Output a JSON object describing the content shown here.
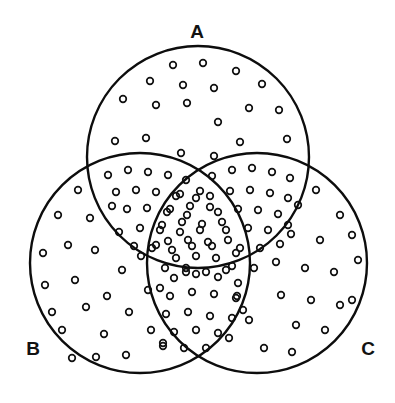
{
  "figure": {
    "type": "venn-diagram",
    "title": "",
    "width": 395,
    "height": 403,
    "background_color": "#ffffff",
    "stroke_color": "#0d0d0d",
    "dot_stroke_color": "#111111",
    "label_color": "#121212"
  },
  "sets": [
    {
      "id": "A",
      "label": "A",
      "label_x": 197,
      "label_y": 33,
      "cx": 198,
      "cy": 157,
      "r": 111
    },
    {
      "id": "B",
      "label": "B",
      "label_x": 33,
      "label_y": 350,
      "cx": 140,
      "cy": 263,
      "r": 110
    },
    {
      "id": "C",
      "label": "C",
      "label_x": 368,
      "label_y": 350,
      "cx": 257,
      "cy": 263,
      "r": 110
    }
  ],
  "shading": {
    "style": "open-circle-stipple",
    "dot_radius": 3.3,
    "description": "All regions of all three circles are filled with small open circles; overlap regions are stippled more densely."
  },
  "chart_data": {
    "type": "venn",
    "title": "",
    "sets": [
      "A",
      "B",
      "C"
    ],
    "region_density": [
      {
        "region": "A only",
        "density": "sparse"
      },
      {
        "region": "B only",
        "density": "sparse"
      },
      {
        "region": "C only",
        "density": "sparse"
      },
      {
        "region": "A and B",
        "density": "dense"
      },
      {
        "region": "A and C",
        "density": "dense"
      },
      {
        "region": "B and C",
        "density": "dense"
      },
      {
        "region": "A and B and C",
        "density": "dense"
      }
    ],
    "legend": [],
    "xlabel": "",
    "ylabel": ""
  },
  "dots": {
    "A_only": [
      [
        173,
        65
      ],
      [
        203,
        63
      ],
      [
        236,
        71
      ],
      [
        150,
        81
      ],
      [
        183,
        85
      ],
      [
        214,
        88
      ],
      [
        262,
        84
      ],
      [
        123,
        99
      ],
      [
        156,
        105
      ],
      [
        187,
        103
      ],
      [
        249,
        108
      ],
      [
        279,
        110
      ],
      [
        218,
        122
      ],
      [
        115,
        141
      ],
      [
        146,
        138
      ],
      [
        240,
        142
      ],
      [
        287,
        139
      ],
      [
        181,
        153
      ],
      [
        214,
        156
      ]
    ],
    "B_only": [
      [
        78,
        190
      ],
      [
        58,
        215
      ],
      [
        90,
        218
      ],
      [
        68,
        245
      ],
      [
        43,
        253
      ],
      [
        95,
        250
      ],
      [
        119,
        232
      ],
      [
        45,
        285
      ],
      [
        75,
        280
      ],
      [
        122,
        270
      ],
      [
        52,
        312
      ],
      [
        86,
        307
      ],
      [
        107,
        296
      ],
      [
        129,
        312
      ],
      [
        62,
        330
      ],
      [
        104,
        334
      ],
      [
        148,
        290
      ],
      [
        141,
        256
      ],
      [
        151,
        330
      ],
      [
        126,
        355
      ],
      [
        163,
        346
      ],
      [
        96,
        357
      ],
      [
        72,
        358
      ]
    ],
    "C_only": [
      [
        316,
        190
      ],
      [
        340,
        215
      ],
      [
        298,
        205
      ],
      [
        291,
        234
      ],
      [
        320,
        240
      ],
      [
        352,
        235
      ],
      [
        276,
        262
      ],
      [
        305,
        268
      ],
      [
        334,
        272
      ],
      [
        358,
        260
      ],
      [
        281,
        295
      ],
      [
        311,
        300
      ],
      [
        340,
        305
      ],
      [
        296,
        325
      ],
      [
        325,
        330
      ],
      [
        352,
        300
      ],
      [
        249,
        320
      ],
      [
        264,
        348
      ],
      [
        292,
        352
      ],
      [
        237,
        296
      ],
      [
        229,
        338
      ]
    ],
    "AB_lens": [
      [
        108,
        175
      ],
      [
        128,
        170
      ],
      [
        148,
        172
      ],
      [
        168,
        175
      ],
      [
        186,
        180
      ],
      [
        116,
        192
      ],
      [
        136,
        190
      ],
      [
        156,
        192
      ],
      [
        176,
        196
      ],
      [
        196,
        198
      ],
      [
        127,
        209
      ],
      [
        147,
        208
      ],
      [
        167,
        212
      ],
      [
        187,
        215
      ],
      [
        112,
        206
      ],
      [
        140,
        228
      ],
      [
        160,
        230
      ],
      [
        180,
        232
      ],
      [
        200,
        230
      ],
      [
        152,
        248
      ],
      [
        172,
        250
      ],
      [
        192,
        246
      ],
      [
        134,
        246
      ],
      [
        165,
        268
      ],
      [
        186,
        268
      ]
    ],
    "AC_lens": [
      [
        212,
        176
      ],
      [
        232,
        170
      ],
      [
        252,
        168
      ],
      [
        272,
        172
      ],
      [
        290,
        178
      ],
      [
        210,
        196
      ],
      [
        230,
        191
      ],
      [
        250,
        190
      ],
      [
        270,
        193
      ],
      [
        288,
        198
      ],
      [
        218,
        212
      ],
      [
        238,
        209
      ],
      [
        258,
        210
      ],
      [
        278,
        214
      ],
      [
        248,
        228
      ],
      [
        268,
        230
      ],
      [
        288,
        225
      ],
      [
        226,
        230
      ],
      [
        240,
        248
      ],
      [
        260,
        248
      ],
      [
        280,
        244
      ],
      [
        212,
        246
      ],
      [
        232,
        266
      ],
      [
        254,
        268
      ]
    ],
    "BC_lens": [
      [
        174,
        278
      ],
      [
        196,
        274
      ],
      [
        218,
        277
      ],
      [
        238,
        283
      ],
      [
        170,
        296
      ],
      [
        192,
        292
      ],
      [
        214,
        294
      ],
      [
        236,
        298
      ],
      [
        166,
        314
      ],
      [
        188,
        312
      ],
      [
        210,
        316
      ],
      [
        232,
        318
      ],
      [
        174,
        332
      ],
      [
        196,
        330
      ],
      [
        218,
        333
      ],
      [
        184,
        348
      ],
      [
        206,
        348
      ],
      [
        163,
        343
      ],
      [
        243,
        310
      ],
      [
        160,
        288
      ]
    ],
    "ABC_center": [
      [
        180,
        194
      ],
      [
        200,
        191
      ],
      [
        170,
        209
      ],
      [
        190,
        206
      ],
      [
        210,
        207
      ],
      [
        162,
        225
      ],
      [
        182,
        222
      ],
      [
        202,
        224
      ],
      [
        222,
        222
      ],
      [
        168,
        241
      ],
      [
        188,
        240
      ],
      [
        208,
        242
      ],
      [
        228,
        240
      ],
      [
        176,
        258
      ],
      [
        196,
        256
      ],
      [
        216,
        258
      ],
      [
        236,
        253
      ],
      [
        186,
        272
      ],
      [
        206,
        272
      ],
      [
        226,
        270
      ],
      [
        156,
        245
      ]
    ]
  }
}
